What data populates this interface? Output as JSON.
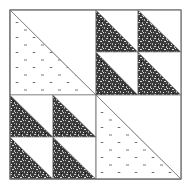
{
  "quilt_block": {
    "name": "Triangle quilt block",
    "layout": "2x2 quadrants; top-left and bottom-right large half-square triangles with circle fabric; top-right and bottom-left each contain 4 small half-square triangles with speckled fabric",
    "colors": {
      "background": "#ffffff",
      "outline": "#777777",
      "dark_fabric": "#2a2a2a",
      "light_fabric": "#ffffff"
    },
    "quadrants": [
      {
        "position": "top-left",
        "type": "large-triangle",
        "fabric": "circles"
      },
      {
        "position": "top-right",
        "type": "four-small-triangles",
        "fabric": "speckled"
      },
      {
        "position": "bottom-left",
        "type": "four-small-triangles",
        "fabric": "speckled"
      },
      {
        "position": "bottom-right",
        "type": "large-triangle",
        "fabric": "circles"
      }
    ]
  }
}
